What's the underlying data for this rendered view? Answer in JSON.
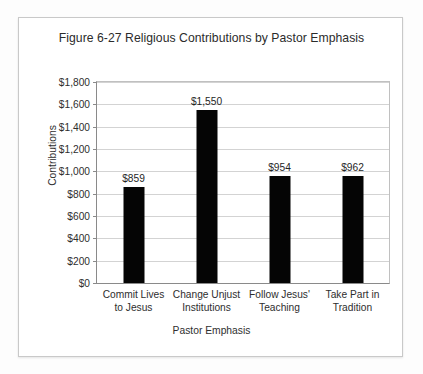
{
  "chart_data": {
    "type": "bar",
    "title": "Figure 6-27 Religious Contributions by Pastor Emphasis",
    "xlabel": "Pastor Emphasis",
    "ylabel": "Contributions",
    "categories": [
      "Commit Lives to Jesus",
      "Change Unjust Institutions",
      "Follow Jesus' Teaching",
      "Take Part in Tradition"
    ],
    "category_lines": [
      [
        "Commit Lives",
        "to Jesus"
      ],
      [
        "Change Unjust",
        "Institutions"
      ],
      [
        "Follow Jesus'",
        "Teaching"
      ],
      [
        "Take Part in",
        "Tradition"
      ]
    ],
    "values": [
      859,
      1550,
      954,
      962
    ],
    "value_labels": [
      "$859",
      "$1,550",
      "$954",
      "$962"
    ],
    "ylim": [
      0,
      1800
    ],
    "ytick_values": [
      0,
      200,
      400,
      600,
      800,
      1000,
      1200,
      1400,
      1600,
      1800
    ],
    "ytick_labels": [
      "$0",
      "$200",
      "$400",
      "$600",
      "$800",
      "$1,000",
      "$1,200",
      "$1,400",
      "$1,600",
      "$1,800"
    ],
    "grid": true,
    "legend": false,
    "bar_color": "#050505",
    "gridline_color": "#d3d3d3",
    "axis_color": "#8a8a8a",
    "plot_background": "#ffffff",
    "figure_border_color": "#c9c9c9"
  }
}
